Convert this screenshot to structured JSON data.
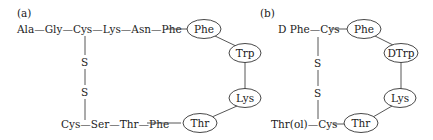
{
  "panels": [
    {
      "label": "(a)",
      "top_chain": "Ala—Gly—Cys—Lys—Asn—Phe",
      "bottom_chain": "Cys—Ser—Thr—Phe",
      "disulfide": [
        "S",
        "S"
      ],
      "ring": [
        "Phe",
        "Trp",
        "Lys",
        "Thr"
      ]
    },
    {
      "label": "(b)",
      "top_chain": "D Phe—Cys",
      "bottom_chain": "Thr(ol)—Cys",
      "disulfide": [
        "S",
        "S"
      ],
      "ring": [
        "Phe",
        "DTrp",
        "Lys",
        "Thr"
      ]
    }
  ]
}
